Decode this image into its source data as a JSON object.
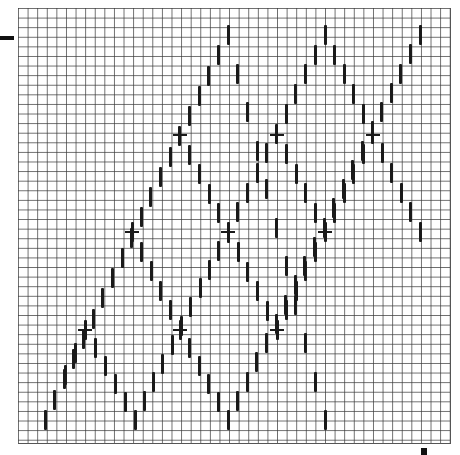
{
  "diagram": {
    "type": "zigzag lattice on graph paper",
    "grid": {
      "left": 18,
      "top": 8,
      "width": 432,
      "height": 435,
      "cell": 9.6,
      "line_color": "#3c3c3c"
    },
    "dash": {
      "height": 20,
      "width": 3,
      "color": "#1a1a1a",
      "step_x": 9.65,
      "step_y": 9.65
    },
    "paths": [
      {
        "name": "path-a",
        "points": [
          [
            45,
            420
          ],
          [
            228,
            35
          ],
          [
            325,
            420
          ]
        ]
      },
      {
        "name": "path-b",
        "points": [
          [
            135,
            420
          ],
          [
            228,
            232
          ],
          [
            325,
            35
          ],
          [
            420,
            232
          ]
        ]
      },
      {
        "name": "path-c",
        "points": [
          [
            228,
            420
          ],
          [
            420,
            35
          ]
        ]
      },
      {
        "name": "path-d",
        "points": [
          [
            45,
            420
          ],
          [
            85,
            330
          ]
        ]
      },
      {
        "name": "path-e",
        "points": [
          [
            85,
            330
          ],
          [
            135,
            420
          ]
        ]
      },
      {
        "name": "path-f",
        "points": [
          [
            180,
            330
          ],
          [
            228,
            420
          ]
        ]
      },
      {
        "name": "path-g",
        "points": [
          [
            277,
            330
          ],
          [
            325,
            232
          ],
          [
            373,
            135
          ]
        ]
      },
      {
        "name": "path-h",
        "points": [
          [
            132,
            232
          ],
          [
            180,
            330
          ]
        ]
      },
      {
        "name": "path-i",
        "points": [
          [
            180,
            135
          ],
          [
            277,
            330
          ]
        ]
      },
      {
        "name": "path-j",
        "points": [
          [
            277,
            135
          ],
          [
            325,
            232
          ]
        ]
      }
    ],
    "crossings": [
      [
        85,
        330
      ],
      [
        180,
        330
      ],
      [
        277,
        330
      ],
      [
        132,
        232
      ],
      [
        228,
        232
      ],
      [
        325,
        232
      ],
      [
        180,
        135
      ],
      [
        277,
        135
      ],
      [
        373,
        135
      ]
    ],
    "edge_marks": [
      {
        "name": "left-tick-mark",
        "x": 0,
        "y": 36,
        "w": 14,
        "h": 4
      },
      {
        "name": "bottom-right-mark",
        "x": 421,
        "y": 448,
        "w": 6,
        "h": 7
      }
    ]
  }
}
